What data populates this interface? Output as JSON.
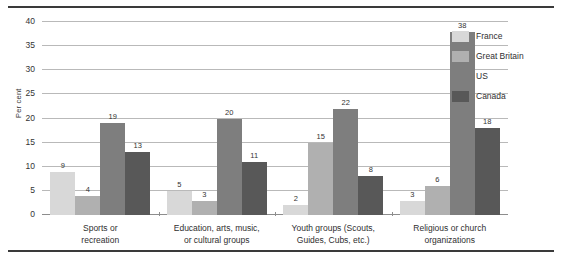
{
  "chart_data": {
    "type": "bar",
    "title": "",
    "xlabel": "",
    "ylabel": "Per cent",
    "ylim": [
      0,
      40
    ],
    "yticks": [
      0,
      5,
      10,
      15,
      20,
      25,
      30,
      35,
      40
    ],
    "grid": true,
    "legend_position": "right",
    "categories": [
      "Sports or recreation",
      "Education, arts, music, or cultural groups",
      "Youth groups (Scouts, Guides, Cubs, etc.)",
      "Religious or church organizations"
    ],
    "category_lines": [
      [
        "Sports or",
        "recreation"
      ],
      [
        "Education, arts, music,",
        "or cultural groups"
      ],
      [
        "Youth groups (Scouts,",
        "Guides, Cubs, etc.)"
      ],
      [
        "Religious or church",
        "organizations"
      ]
    ],
    "series": [
      {
        "name": "France",
        "color": "#d8d8d8",
        "values": [
          9,
          5,
          2,
          3
        ]
      },
      {
        "name": "Great Britain",
        "color": "#b0b0b0",
        "values": [
          4,
          3,
          15,
          6
        ]
      },
      {
        "name": "US",
        "color": "#7e7e7e",
        "values": [
          19,
          20,
          22,
          38
        ]
      },
      {
        "name": "Canada",
        "color": "#585858",
        "values": [
          13,
          11,
          8,
          18
        ]
      }
    ]
  },
  "axis": {
    "ytick_labels": [
      "0",
      "5",
      "10",
      "15",
      "20",
      "25",
      "30",
      "35",
      "40"
    ],
    "ylabel": "Per cent"
  },
  "legend": {
    "items": [
      {
        "label": "France",
        "color": "#d8d8d8"
      },
      {
        "label": "Great Britain",
        "color": "#b0b0b0"
      },
      {
        "label": "US",
        "color": "#7e7e7e"
      },
      {
        "label": "Canada",
        "color": "#585858"
      }
    ]
  }
}
